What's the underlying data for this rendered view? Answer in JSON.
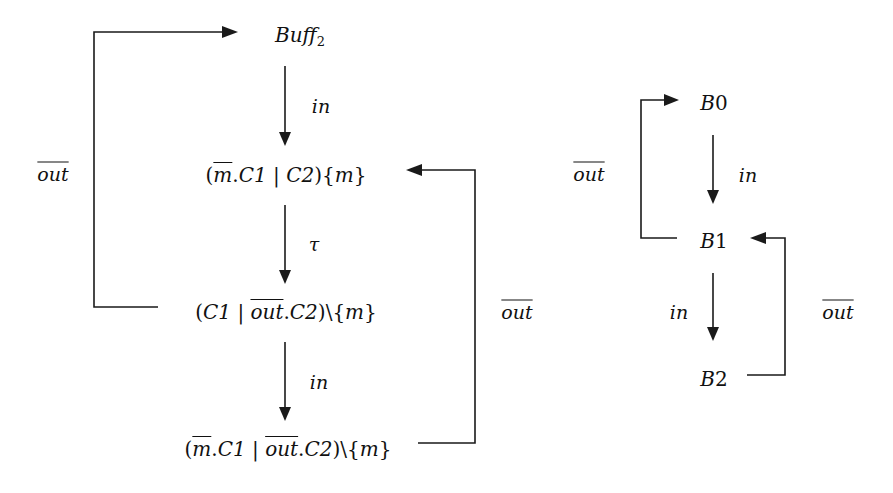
{
  "left_diagram": {
    "nodes": {
      "buff2": {
        "name": "Buff",
        "subscript": "2"
      },
      "state1": {
        "open": "(",
        "m": "m",
        "dot": ".",
        "c1": "C1",
        "bar": " | ",
        "c2": "C2",
        "close": ")",
        "restrict": "{",
        "m2": "m",
        "rclose": "}"
      },
      "state2": {
        "open": "(",
        "c1": "C1",
        "bar": " | ",
        "out": "out",
        "dot": ".",
        "c2": "C2",
        "close": ")",
        "restrict": "\\{",
        "m": "m",
        "rclose": "}"
      },
      "state3": {
        "open": "(",
        "m": "m",
        "dot1": ".",
        "c1": "C1",
        "bar": " | ",
        "out": "out",
        "dot2": ".",
        "c2": "C2",
        "close": ")",
        "restrict": "\\{",
        "m2": "m",
        "rclose": "}"
      }
    },
    "edges": [
      {
        "from": "buff2",
        "to": "state1",
        "label": "in"
      },
      {
        "from": "state1",
        "to": "state2",
        "label": "τ"
      },
      {
        "from": "state2",
        "to": "state3",
        "label": "in"
      },
      {
        "from": "state2",
        "to": "buff2",
        "label": "out",
        "overline": true
      },
      {
        "from": "state3",
        "to": "state1",
        "label": "out",
        "overline": true
      }
    ]
  },
  "right_diagram": {
    "nodes": {
      "b0": {
        "letter": "B",
        "index": "0"
      },
      "b1": {
        "letter": "B",
        "index": "1"
      },
      "b2": {
        "letter": "B",
        "index": "2"
      }
    },
    "edges": [
      {
        "from": "b0",
        "to": "b1",
        "label": "in"
      },
      {
        "from": "b1",
        "to": "b2",
        "label": "in"
      },
      {
        "from": "b1",
        "to": "b0",
        "label": "out",
        "overline": true
      },
      {
        "from": "b2",
        "to": "b1",
        "label": "out",
        "overline": true
      }
    ]
  }
}
